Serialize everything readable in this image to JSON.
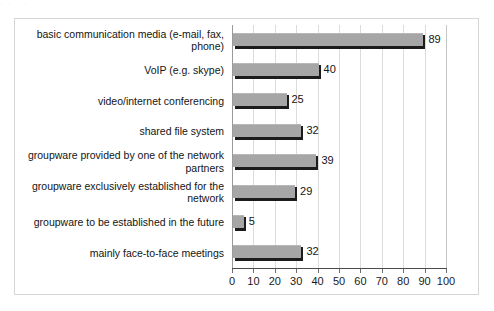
{
  "chart_data": {
    "type": "bar",
    "orientation": "horizontal",
    "title": "",
    "subtitle": "",
    "xlabel": "",
    "ylabel": "",
    "xlim": [
      0,
      100
    ],
    "xticks": [
      0,
      10,
      20,
      30,
      40,
      50,
      60,
      70,
      80,
      90,
      100
    ],
    "grid": true,
    "grid_axis": "x",
    "legend": false,
    "legend_position": "none",
    "bar_color": "#a6a6a6",
    "shadow_color": "#1c1c1c",
    "gridline_color": "#dcdcdc",
    "axis_color": "#4a4a4a",
    "categories": [
      "basic communication media (e-mail, fax, phone)",
      "VoIP (e.g. skype)",
      "video/internet conferencing",
      "shared file system",
      "groupware provided by one of the network partners",
      "groupware exclusively established for the network",
      "groupware to be established in the future",
      "mainly face-to-face meetings"
    ],
    "values": [
      89,
      40,
      25,
      32,
      39,
      29,
      5,
      32
    ],
    "value_labels": [
      "89",
      "40",
      "25",
      "32",
      "39",
      "29",
      "5",
      "32"
    ]
  },
  "figure": {
    "background": "#ffffff",
    "border_color": "#d6d6d6"
  },
  "artifact": {
    "top_edge_text": "··  ·        ·            ·   ·"
  }
}
